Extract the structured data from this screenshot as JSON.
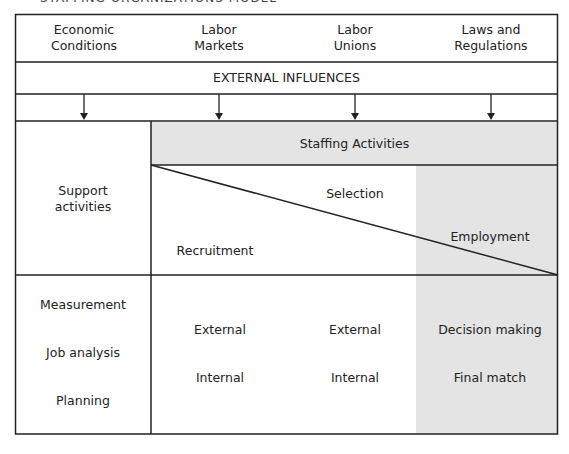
{
  "title": "STAFFING ORGANIZATIONS MODEL",
  "external_factors": [
    {
      "line1": "Economic",
      "line2": "Conditions"
    },
    {
      "line1": "Labor",
      "line2": "Markets"
    },
    {
      "line1": "Labor",
      "line2": "Unions"
    },
    {
      "line1": "Laws and",
      "line2": "Regulations"
    }
  ],
  "external_influences_label": "EXTERNAL INFLUENCES",
  "support_activities_label": {
    "line1": "Support",
    "line2": "activities"
  },
  "staffing_activities_label": "Staffing Activities",
  "stages": {
    "recruitment": "Recruitment",
    "selection": "Selection",
    "employment": "Employment"
  },
  "support_items": [
    "Measurement",
    "Job analysis",
    "Planning"
  ],
  "recruitment_items": [
    "External",
    "Internal"
  ],
  "selection_items": [
    "External",
    "Internal"
  ],
  "employment_items": [
    "Decision making",
    "Final match"
  ],
  "colors": {
    "shade": "#e4e4e4",
    "line": "#222222"
  }
}
